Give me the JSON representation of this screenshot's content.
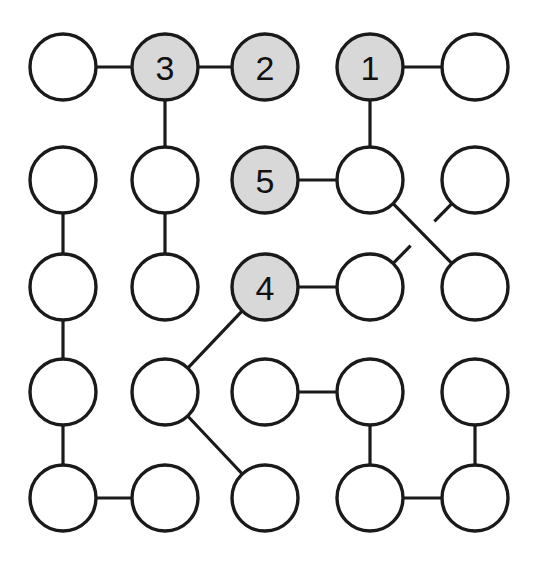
{
  "figure": {
    "width": 544,
    "height": 563,
    "background_color": "#ffffff"
  },
  "style": {
    "node_radius": 33,
    "node_fill_plain": "#ffffff",
    "node_fill_shaded": "#d8d8d8",
    "node_stroke_color": "#1a1a1a",
    "node_stroke_width": 3.4,
    "edge_stroke_color": "#1a1a1a",
    "edge_stroke_width": 3.2,
    "label_color": "#111111",
    "label_font_size": 34
  },
  "grid": {
    "rows": 5,
    "columns": 5,
    "column_centers_x": [
      63,
      165,
      265,
      370,
      475
    ],
    "row_centers_y": [
      67,
      180,
      287,
      392,
      498
    ]
  },
  "nodes": [
    {
      "id": "r1c1",
      "row": 1,
      "col": 1,
      "cx": 63,
      "cy": 67,
      "label": "",
      "shaded": false
    },
    {
      "id": "r1c2",
      "row": 1,
      "col": 2,
      "cx": 165,
      "cy": 67,
      "label": "3",
      "shaded": true
    },
    {
      "id": "r1c3",
      "row": 1,
      "col": 3,
      "cx": 265,
      "cy": 67,
      "label": "2",
      "shaded": true
    },
    {
      "id": "r1c4",
      "row": 1,
      "col": 4,
      "cx": 370,
      "cy": 67,
      "label": "1",
      "shaded": true
    },
    {
      "id": "r1c5",
      "row": 1,
      "col": 5,
      "cx": 475,
      "cy": 67,
      "label": "",
      "shaded": false
    },
    {
      "id": "r2c1",
      "row": 2,
      "col": 1,
      "cx": 63,
      "cy": 180,
      "label": "",
      "shaded": false
    },
    {
      "id": "r2c2",
      "row": 2,
      "col": 2,
      "cx": 165,
      "cy": 180,
      "label": "",
      "shaded": false
    },
    {
      "id": "r2c3",
      "row": 2,
      "col": 3,
      "cx": 265,
      "cy": 180,
      "label": "5",
      "shaded": true
    },
    {
      "id": "r2c4",
      "row": 2,
      "col": 4,
      "cx": 370,
      "cy": 180,
      "label": "",
      "shaded": false
    },
    {
      "id": "r2c5",
      "row": 2,
      "col": 5,
      "cx": 475,
      "cy": 180,
      "label": "",
      "shaded": false
    },
    {
      "id": "r3c1",
      "row": 3,
      "col": 1,
      "cx": 63,
      "cy": 287,
      "label": "",
      "shaded": false
    },
    {
      "id": "r3c2",
      "row": 3,
      "col": 2,
      "cx": 165,
      "cy": 287,
      "label": "",
      "shaded": false
    },
    {
      "id": "r3c3",
      "row": 3,
      "col": 3,
      "cx": 265,
      "cy": 287,
      "label": "4",
      "shaded": true
    },
    {
      "id": "r3c4",
      "row": 3,
      "col": 4,
      "cx": 370,
      "cy": 287,
      "label": "",
      "shaded": false
    },
    {
      "id": "r3c5",
      "row": 3,
      "col": 5,
      "cx": 475,
      "cy": 287,
      "label": "",
      "shaded": false
    },
    {
      "id": "r4c1",
      "row": 4,
      "col": 1,
      "cx": 63,
      "cy": 392,
      "label": "",
      "shaded": false
    },
    {
      "id": "r4c2",
      "row": 4,
      "col": 2,
      "cx": 165,
      "cy": 392,
      "label": "",
      "shaded": false
    },
    {
      "id": "r4c3",
      "row": 4,
      "col": 3,
      "cx": 265,
      "cy": 392,
      "label": "",
      "shaded": false
    },
    {
      "id": "r4c4",
      "row": 4,
      "col": 4,
      "cx": 370,
      "cy": 392,
      "label": "",
      "shaded": false
    },
    {
      "id": "r4c5",
      "row": 4,
      "col": 5,
      "cx": 475,
      "cy": 392,
      "label": "",
      "shaded": false
    },
    {
      "id": "r5c1",
      "row": 5,
      "col": 1,
      "cx": 63,
      "cy": 498,
      "label": "",
      "shaded": false
    },
    {
      "id": "r5c2",
      "row": 5,
      "col": 2,
      "cx": 165,
      "cy": 498,
      "label": "",
      "shaded": false
    },
    {
      "id": "r5c3",
      "row": 5,
      "col": 3,
      "cx": 265,
      "cy": 498,
      "label": "",
      "shaded": false
    },
    {
      "id": "r5c4",
      "row": 5,
      "col": 4,
      "cx": 370,
      "cy": 498,
      "label": "",
      "shaded": false
    },
    {
      "id": "r5c5",
      "row": 5,
      "col": 5,
      "cx": 475,
      "cy": 498,
      "label": "",
      "shaded": false
    }
  ],
  "edges": [
    {
      "from": "r1c1",
      "to": "r1c2",
      "kind": "horizontal",
      "broken": false
    },
    {
      "from": "r1c2",
      "to": "r1c3",
      "kind": "horizontal",
      "broken": false
    },
    {
      "from": "r1c4",
      "to": "r1c5",
      "kind": "horizontal",
      "broken": false
    },
    {
      "from": "r1c2",
      "to": "r2c2",
      "kind": "vertical",
      "broken": false
    },
    {
      "from": "r1c4",
      "to": "r2c4",
      "kind": "vertical",
      "broken": false
    },
    {
      "from": "r2c3",
      "to": "r2c4",
      "kind": "horizontal",
      "broken": false
    },
    {
      "from": "r2c1",
      "to": "r3c1",
      "kind": "vertical",
      "broken": false
    },
    {
      "from": "r2c2",
      "to": "r3c2",
      "kind": "vertical",
      "broken": false
    },
    {
      "from": "r2c4",
      "to": "r3c5",
      "kind": "diagonal",
      "broken": false
    },
    {
      "from": "r2c5",
      "to": "r3c4",
      "kind": "diagonal",
      "broken": true
    },
    {
      "from": "r3c1",
      "to": "r4c1",
      "kind": "vertical",
      "broken": false
    },
    {
      "from": "r3c3",
      "to": "r3c4",
      "kind": "horizontal",
      "broken": false
    },
    {
      "from": "r3c3",
      "to": "r4c2",
      "kind": "diagonal",
      "broken": false
    },
    {
      "from": "r4c1",
      "to": "r5c1",
      "kind": "vertical",
      "broken": false
    },
    {
      "from": "r4c2",
      "to": "r5c3",
      "kind": "diagonal",
      "broken": false
    },
    {
      "from": "r4c3",
      "to": "r4c4",
      "kind": "horizontal",
      "broken": false
    },
    {
      "from": "r4c4",
      "to": "r5c4",
      "kind": "vertical",
      "broken": false
    },
    {
      "from": "r4c5",
      "to": "r5c5",
      "kind": "vertical",
      "broken": false
    },
    {
      "from": "r5c1",
      "to": "r5c2",
      "kind": "horizontal",
      "broken": false
    },
    {
      "from": "r5c4",
      "to": "r5c5",
      "kind": "horizontal",
      "broken": false
    }
  ]
}
